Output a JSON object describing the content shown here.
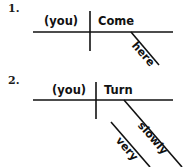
{
  "page": {
    "background_color": "#ffffff",
    "line_color": "#111111",
    "text_color": "#111111"
  },
  "diagrams": [
    {
      "number_label": "1.",
      "sentence": "Come here.",
      "subject": "(you)",
      "verb": "Come",
      "modifier": "here",
      "submodifier": null
    },
    {
      "number_label": "2.",
      "sentence": "Turn very slowly.",
      "subject": "(you)",
      "verb": "Turn",
      "modifier": "slowly",
      "submodifier": "very"
    }
  ],
  "geometry": {
    "diagram1": {
      "baseline": {
        "x1": 33,
        "y1": 32,
        "x2": 173,
        "y2": 32
      },
      "divider": {
        "x1": 90,
        "y1": 11,
        "x2": 90,
        "y2": 51
      },
      "modifier_line": {
        "x1": 131,
        "y1": 32,
        "x2": 159,
        "y2": 65
      }
    },
    "diagram2": {
      "baseline": {
        "x1": 33,
        "y1": 100,
        "x2": 173,
        "y2": 100
      },
      "divider": {
        "x1": 96,
        "y1": 82,
        "x2": 96,
        "y2": 119
      },
      "modifier_line": {
        "x1": 124,
        "y1": 100,
        "x2": 182,
        "y2": 167
      },
      "submodifier_line": {
        "x1": 111,
        "y1": 122,
        "x2": 150,
        "y2": 167
      }
    }
  }
}
